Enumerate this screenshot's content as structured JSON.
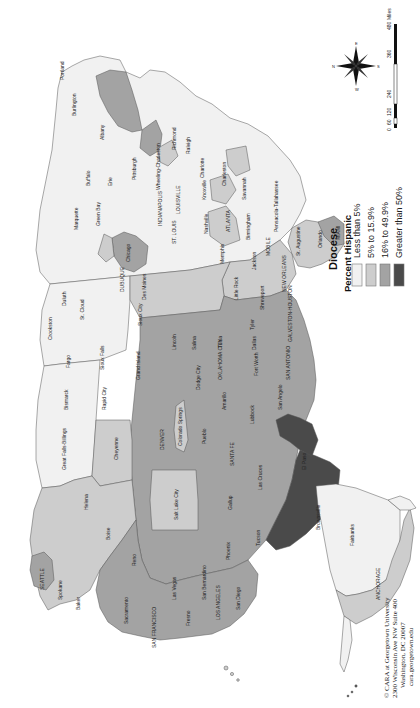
{
  "map": {
    "subject": "Catholic dioceses of the United States",
    "orientation": "rotated 90 degrees counterclockwise (north points left)",
    "colors": {
      "less_than_5": "#f1f1f1",
      "5_to_15_9": "#cdcdcd",
      "16_to_49_9": "#a3a3a3",
      "greater_than_50": "#4a4a4a",
      "border": "#555555",
      "water": "#ffffff"
    }
  },
  "legend": {
    "title": "Diocese",
    "subtitle": "Percent Hispanic",
    "items": [
      {
        "label": "Less than 5%",
        "color": "#f1f1f1"
      },
      {
        "label": "5% to 15.9%",
        "color": "#cdcdcd"
      },
      {
        "label": "16% to 49.9%",
        "color": "#a3a3a3"
      },
      {
        "label": "Greater than 50%",
        "color": "#4a4a4a"
      }
    ]
  },
  "scale_bar": {
    "ticks": [
      "0",
      "60",
      "120",
      "240",
      "360",
      "480"
    ],
    "unit": "Miles"
  },
  "compass": {
    "labels": [
      "N",
      "S",
      "E",
      "W"
    ]
  },
  "credit": {
    "line1": "© CARA at Georgetown University",
    "line2": "2300 Wisconsin Ave NW Suite 400",
    "line3": "Washington, DC 20007",
    "line4": "cara.georgetown.edu"
  },
  "labels": {
    "portland_me": "Portland",
    "burlington": "Burlington",
    "boston": "Boston",
    "albany": "Albany",
    "buffalo": "Buffalo",
    "erie": "Erie",
    "pittsburgh": "Pittsburgh",
    "cleveland": "Cleveland",
    "detroit": "Detroit",
    "lansing": "Lansing",
    "marquette": "Marquette",
    "green_bay": "Green Bay",
    "chicago": "Chicago",
    "rockford": "Rockford",
    "dubuque": "DUBUQUE",
    "duluth": "Duluth",
    "crookston": "Crookston",
    "st_cloud": "St. Cloud",
    "new_ulm": "New Ulm",
    "la_crosse": "La Crosse",
    "winona": "Winona",
    "sioux_city": "Sioux City",
    "des_moines": "Des Moines",
    "fargo": "Fargo",
    "bismarck": "Bismarck",
    "sioux_falls": "Sioux Falls",
    "rapid_city": "Rapid City",
    "grand_island": "Grand Island",
    "lincoln": "Lincoln",
    "omaha": "OMAHA",
    "salina": "Salina",
    "kansas_city": "KANSAS CITY",
    "dodge_city": "Dodge City",
    "wichita": "Wichita",
    "great_falls": "Great Falls-Billings",
    "helena": "Helena",
    "cheyenne": "Cheyenne",
    "denver": "DENVER",
    "colorado_springs": "Colorado Springs",
    "pueblo": "Pueblo",
    "santa_fe": "SANTA FE",
    "gallup": "Gallup",
    "las_cruces": "Las Cruces",
    "el_paso": "El Paso",
    "tucson": "Tucson",
    "phoenix": "Phoenix",
    "salt_lake_city": "Salt Lake City",
    "boise": "Boise",
    "reno": "Reno",
    "las_vegas": "Las Vegas",
    "baker": "Baker",
    "portland_or": "PORTLAND",
    "seattle": "SEATTLE",
    "spokane": "Spokane",
    "yakima": "Yakima",
    "sacramento": "Sacramento",
    "santa_rosa": "Santa Rosa",
    "san_francisco": "SAN FRANCISCO",
    "oakland": "Oakland",
    "san_jose": "San Jose",
    "stockton": "Stockton",
    "fresno": "Fresno",
    "monterey": "Monterey",
    "los_angeles": "LOS ANGELES",
    "orange": "Orange",
    "san_bernardino": "San Bernardino",
    "san_diego": "San Diego",
    "amarillo": "Amarillo",
    "lubbock": "Lubbock",
    "san_angelo": "San Angelo",
    "oklahoma_city": "OKLAHOMA CITY",
    "tulsa": "Tulsa",
    "fort_worth": "Fort Worth",
    "dallas": "Dallas",
    "tyler": "Tyler",
    "austin": "Austin",
    "san_antonio": "SAN ANTONIO",
    "galveston_houston": "GALVESTON-HOUSTON",
    "victoria": "Victoria",
    "corpus_christi": "Corpus Christi",
    "brownsville": "Brownsville",
    "laredo": "Laredo",
    "little_rock": "Little Rock",
    "shreveport": "Shreveport",
    "new_orleans": "NEW ORLEANS",
    "memphis": "Memphis",
    "nashville": "Nashville",
    "knoxville": "Knoxville",
    "louisville": "LOUISVILLE",
    "lexington": "Lexington",
    "indianapolis": "INDIANAPOLIS",
    "cincinnati": "CINCINNATI",
    "columbus": "Columbus",
    "st_louis": "ST. LOUIS",
    "springfield": "Springfield",
    "jackson": "Jackson",
    "mobile": "MOBILE",
    "birmingham": "Birmingham",
    "atlanta": "ATLANTA",
    "savannah": "Savannah",
    "charleston": "Charleston",
    "charlotte": "Charlotte",
    "raleigh": "Raleigh",
    "richmond": "Richmond",
    "wheeling": "Wheeling-Charleston",
    "baltimore": "BALTIMORE",
    "washington": "WASHINGTON",
    "philadelphia": "PHILADELPHIA",
    "new_york": "NEW YORK",
    "hartford": "HARTFORD",
    "providence": "Providence",
    "st_augustine": "St. Augustine",
    "orlando": "Orlando",
    "miami": "MIAMI",
    "pensacola": "Pensacola-Tallahassee",
    "anchorage": "ANCHORAGE",
    "fairbanks": "Fairbanks",
    "juneau": "Juneau"
  }
}
